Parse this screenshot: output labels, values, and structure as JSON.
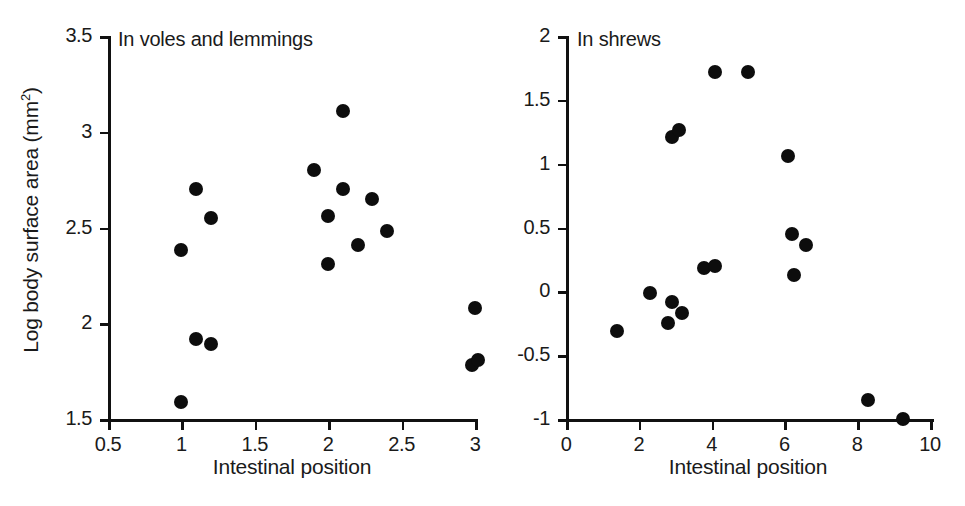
{
  "figure": {
    "panel_count": 2,
    "marker_color": "#0d0d0d",
    "axis_color": "#111111",
    "background": "#ffffff"
  },
  "left_panel": {
    "title": "In voles and lemmings",
    "xlabel": "Intestinal position",
    "ylabel_main": "Log body surface area (mm",
    "ylabel_sup": "2",
    "ylabel_close": ")",
    "xticks": [
      "0.5",
      "1",
      "1.5",
      "2",
      "2.5",
      "3"
    ],
    "yticks": [
      "3.5",
      "3",
      "2.5",
      "2",
      "1.5"
    ]
  },
  "right_panel": {
    "title": "In shrews",
    "xlabel": "Intestinal position",
    "xticks": [
      "0",
      "2",
      "4",
      "6",
      "8",
      "10"
    ],
    "yticks": [
      "2",
      "1.5",
      "1",
      "0.5",
      "0",
      "-0.5",
      "-1"
    ]
  },
  "chart_data": [
    {
      "type": "scatter",
      "title": "In voles and lemmings",
      "xlabel": "Intestinal position",
      "ylabel": "Log body surface area (mm2)",
      "xlim": [
        0.5,
        3.0
      ],
      "ylim": [
        1.5,
        3.5
      ],
      "xticks": [
        0.5,
        1.0,
        1.5,
        2.0,
        2.5,
        3.0
      ],
      "yticks": [
        1.5,
        2.0,
        2.5,
        3.0,
        3.5
      ],
      "grid": false,
      "legend": "none",
      "series": [
        {
          "name": "voles and lemmings",
          "marker": "filled-circle",
          "color": "#0d0d0d",
          "points": [
            {
              "x": 1.0,
              "y": 2.38
            },
            {
              "x": 1.1,
              "y": 2.7
            },
            {
              "x": 1.2,
              "y": 2.55
            },
            {
              "x": 1.1,
              "y": 1.92
            },
            {
              "x": 1.2,
              "y": 1.89
            },
            {
              "x": 1.0,
              "y": 1.59
            },
            {
              "x": 1.9,
              "y": 2.8
            },
            {
              "x": 2.0,
              "y": 2.56
            },
            {
              "x": 2.0,
              "y": 2.31
            },
            {
              "x": 2.1,
              "y": 3.11
            },
            {
              "x": 2.1,
              "y": 2.7
            },
            {
              "x": 2.2,
              "y": 2.41
            },
            {
              "x": 2.3,
              "y": 2.65
            },
            {
              "x": 2.4,
              "y": 2.48
            },
            {
              "x": 3.0,
              "y": 2.08
            },
            {
              "x": 2.98,
              "y": 1.78
            },
            {
              "x": 3.02,
              "y": 1.81
            }
          ]
        }
      ]
    },
    {
      "type": "scatter",
      "title": "In shrews",
      "xlabel": "Intestinal position",
      "ylabel": "Log body surface area (mm2)",
      "xlim": [
        0,
        10
      ],
      "ylim": [
        -1,
        2
      ],
      "xticks": [
        0,
        2,
        4,
        6,
        8,
        10
      ],
      "yticks": [
        -1,
        -0.5,
        0,
        0.5,
        1,
        1.5,
        2
      ],
      "grid": false,
      "legend": "none",
      "series": [
        {
          "name": "shrews",
          "marker": "filled-circle",
          "color": "#0d0d0d",
          "points": [
            {
              "x": 1.4,
              "y": -0.31
            },
            {
              "x": 2.3,
              "y": -0.01
            },
            {
              "x": 2.8,
              "y": -0.25
            },
            {
              "x": 2.9,
              "y": -0.08
            },
            {
              "x": 2.9,
              "y": 1.21
            },
            {
              "x": 3.1,
              "y": 1.26
            },
            {
              "x": 3.2,
              "y": -0.17
            },
            {
              "x": 3.8,
              "y": 0.18
            },
            {
              "x": 4.1,
              "y": 0.2
            },
            {
              "x": 4.1,
              "y": 1.72
            },
            {
              "x": 5.0,
              "y": 1.72
            },
            {
              "x": 6.1,
              "y": 1.06
            },
            {
              "x": 6.2,
              "y": 0.45
            },
            {
              "x": 6.25,
              "y": 0.13
            },
            {
              "x": 6.6,
              "y": 0.36
            },
            {
              "x": 8.3,
              "y": -0.85
            },
            {
              "x": 9.25,
              "y": -1.0
            }
          ]
        }
      ]
    }
  ]
}
